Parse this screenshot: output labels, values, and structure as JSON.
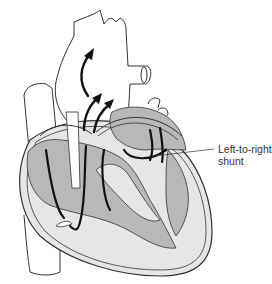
{
  "figure": {
    "type": "anatomical-diagram",
    "colors": {
      "background": "#ffffff",
      "outline": "#333333",
      "chamber_fill": "#b8b8b8",
      "muscle_fill": "#e6e6e6",
      "arrow": "#111111"
    },
    "annotations": [
      {
        "line1": "Left-to-right",
        "line2": "shunt"
      }
    ]
  }
}
